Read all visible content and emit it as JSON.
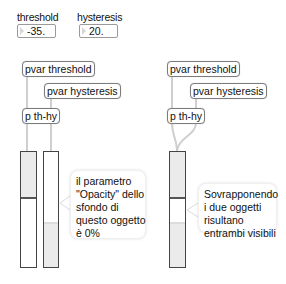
{
  "controls": {
    "threshold": {
      "label": "threshold",
      "value": "-35."
    },
    "hysteresis": {
      "label": "hysteresis",
      "value": "20."
    }
  },
  "left_patch": {
    "pvar_threshold": "pvar threshold",
    "pvar_hysteresis": "pvar hysteresis",
    "subpatch": "p th-hy",
    "comment_lines": [
      "il parametro",
      "\"Opacity\" dello",
      "sfondo di",
      "questo oggetto",
      "è 0%"
    ]
  },
  "right_patch": {
    "pvar_threshold": "pvar threshold",
    "pvar_hysteresis": "pvar hysteresis",
    "subpatch": "p th-hy",
    "comment_lines": [
      "Sovrapponendo",
      "i due oggetti",
      "risultano",
      "entrambi visibili"
    ]
  },
  "colors": {
    "slider_fill": "#ebebeb",
    "slider_border": "#444444",
    "box_border": "#7c7c7c",
    "wire": "#c8c8c8"
  }
}
